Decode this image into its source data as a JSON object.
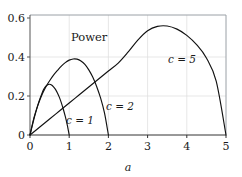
{
  "figure": {
    "title": "Power",
    "background": "#ffffff",
    "frame_color": "#9aa0a6",
    "curve_color": "#111111",
    "grid_color": "#d9d9d9"
  },
  "chart_data": {
    "type": "line",
    "title": "Power",
    "xlabel": "a",
    "ylabel": "",
    "xlim": [
      0,
      5
    ],
    "ylim": [
      0,
      0.6
    ],
    "xticks": [
      0,
      1,
      2,
      3,
      4,
      5
    ],
    "xticklabels": [
      "0",
      "1",
      "2",
      "3",
      "4",
      "5"
    ],
    "yticks": [
      0,
      0.2,
      0.4,
      0.6
    ],
    "yticklabels": [
      "0",
      "0.2",
      "0.4",
      "0.6"
    ],
    "grid": true,
    "legend": "inline-annotations",
    "annotations": [
      {
        "text": "Power",
        "x": 1.05,
        "y": 0.525
      },
      {
        "text": "c = 1",
        "x": 0.97,
        "y": 0.085
      },
      {
        "text": "c = 2",
        "x": 1.97,
        "y": 0.16
      },
      {
        "text": "c = 5",
        "x": 3.55,
        "y": 0.4
      }
    ],
    "series": [
      {
        "name": "c = 1",
        "label": "c = 1",
        "peak": {
          "x": 0.5,
          "y": 0.26
        },
        "xend": 1,
        "x": [
          0,
          0.05,
          0.1,
          0.15,
          0.2,
          0.25,
          0.3,
          0.35,
          0.4,
          0.45,
          0.5,
          0.55,
          0.6,
          0.65,
          0.7,
          0.75,
          0.8,
          0.85,
          0.9,
          0.95,
          1.0
        ],
        "values": [
          0,
          0.042,
          0.082,
          0.119,
          0.153,
          0.184,
          0.211,
          0.234,
          0.249,
          0.258,
          0.26,
          0.256,
          0.247,
          0.234,
          0.216,
          0.193,
          0.165,
          0.132,
          0.095,
          0.052,
          0.0
        ]
      },
      {
        "name": "c = 2",
        "label": "c = 2",
        "peak": {
          "x": 1.15,
          "y": 0.39
        },
        "xend": 2,
        "x": [
          0,
          0.1,
          0.2,
          0.3,
          0.4,
          0.5,
          0.6,
          0.7,
          0.8,
          0.9,
          1.0,
          1.1,
          1.2,
          1.3,
          1.4,
          1.5,
          1.6,
          1.7,
          1.8,
          1.9,
          2.0
        ],
        "values": [
          0,
          0.088,
          0.152,
          0.204,
          0.245,
          0.278,
          0.307,
          0.331,
          0.353,
          0.371,
          0.384,
          0.39,
          0.389,
          0.38,
          0.362,
          0.334,
          0.297,
          0.249,
          0.19,
          0.113,
          0.0
        ]
      },
      {
        "name": "c = 5",
        "label": "c = 5",
        "peak": {
          "x": 3.4,
          "y": 0.56
        },
        "xend": 5,
        "x": [
          0,
          0.25,
          0.5,
          0.75,
          1.0,
          1.25,
          1.5,
          1.75,
          2.0,
          2.25,
          2.5,
          2.75,
          3.0,
          3.25,
          3.5,
          3.75,
          4.0,
          4.25,
          4.5,
          4.75,
          5.0
        ],
        "values": [
          0,
          0.041,
          0.082,
          0.123,
          0.164,
          0.205,
          0.246,
          0.287,
          0.328,
          0.369,
          0.425,
          0.487,
          0.535,
          0.557,
          0.559,
          0.543,
          0.511,
          0.463,
          0.395,
          0.276,
          0.0
        ]
      }
    ]
  }
}
